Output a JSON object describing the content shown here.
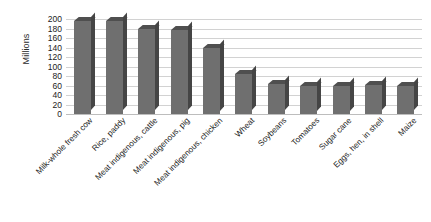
{
  "chart_data": {
    "type": "bar",
    "title": "",
    "xlabel": "",
    "ylabel": "Millions",
    "ylim": [
      0,
      200
    ],
    "yticks": [
      200,
      180,
      160,
      140,
      120,
      100,
      80,
      60,
      40,
      20,
      0
    ],
    "grid": true,
    "legend": null,
    "categories": [
      "Milk-whole fresh cow",
      "Rice, paddy",
      "Meat indigenous, cattle",
      "Meat indigenous, pig",
      "Meat indigenous, chicken",
      "Wheat",
      "Soybeans",
      "Tomatoes",
      "Sugar cane",
      "Eggs, hen, in shell",
      "Maize"
    ],
    "values": [
      195,
      195,
      178,
      177,
      140,
      85,
      63,
      60,
      60,
      62,
      58
    ],
    "series": [
      {
        "name": "Production",
        "values": [
          195,
          195,
          178,
          177,
          140,
          85,
          63,
          60,
          60,
          62,
          58
        ]
      }
    ],
    "style": {
      "bar_face": "#6f6f6f",
      "bar_top": "#4f4f4f",
      "bar_side": "#454545",
      "gridline": "#d2d2d2",
      "background": "#ffffff",
      "text": "#1a1a1a"
    }
  }
}
